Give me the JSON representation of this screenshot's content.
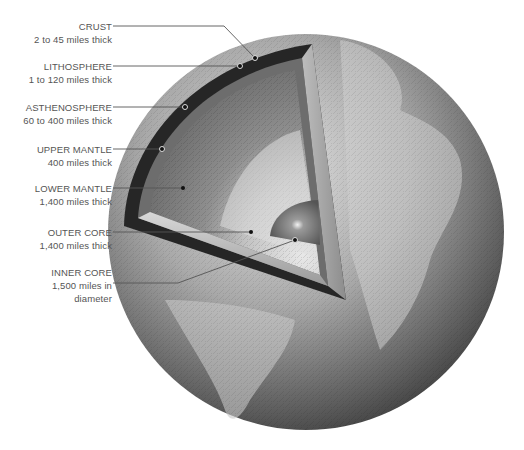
{
  "figure": {
    "type": "cutaway diagram",
    "colors": {
      "background": "#ffffff",
      "label_text": "#555555",
      "leader_line": "#555555",
      "globe_light": "#d9d9d9",
      "globe_dark": "#3a3a3a",
      "crust_band": "#2b2b2b",
      "mantle": "#8a8a8a",
      "core_outer": "#cfcfcf",
      "core_inner": "#6f6f6f"
    }
  },
  "layers": [
    {
      "name": "CRUST",
      "desc": "2 to 45 miles thick",
      "desc2": ""
    },
    {
      "name": "LITHOSPHERE",
      "desc": "1 to 120 miles thick",
      "desc2": ""
    },
    {
      "name": "ASTHENOSPHERE",
      "desc": "60 to 400 miles thick",
      "desc2": ""
    },
    {
      "name": "UPPER MANTLE",
      "desc": "400 miles thick",
      "desc2": ""
    },
    {
      "name": "LOWER MANTLE",
      "desc": "1,400 miles thick",
      "desc2": ""
    },
    {
      "name": "OUTER CORE",
      "desc": "1,400 miles thick",
      "desc2": ""
    },
    {
      "name": "INNER CORE",
      "desc": "1,500 miles in",
      "desc2": "diameter"
    }
  ]
}
